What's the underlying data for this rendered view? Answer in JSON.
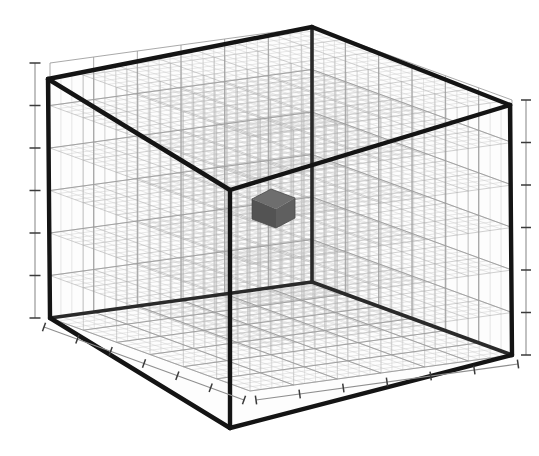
{
  "figure": {
    "title": "",
    "background_color": "#ffffff",
    "width": 539,
    "height": 456
  },
  "chart_data": {
    "type": "scatter",
    "title": "",
    "subtitle": "",
    "xlabel": "",
    "ylabel": "",
    "zlabel": "",
    "projection": "3d",
    "grid": true,
    "legend": null,
    "legend_position": "none",
    "xlim": [
      0,
      6
    ],
    "ylim": [
      0,
      6
    ],
    "zlim": [
      0,
      6
    ],
    "xticks": [
      "",
      "",
      "",
      "",
      "",
      "",
      ""
    ],
    "yticks": [
      "",
      "",
      "",
      "",
      "",
      "",
      ""
    ],
    "zticks": [
      "",
      "",
      "",
      "",
      "",
      "",
      ""
    ],
    "tick_labels_visible": false,
    "tick_count_x": 7,
    "tick_count_y": 7,
    "tick_count_z": 7,
    "mesh_divisions": 24,
    "view_elevation_deg": 22,
    "view_azimuth_deg": -55,
    "series": [
      {
        "name": "voxel",
        "marker": "cube",
        "color": "#5f5f5f",
        "edge_color": "#4a4a4a",
        "points": [
          {
            "x": 3,
            "y": 3,
            "z": 3,
            "size": 1
          }
        ]
      }
    ],
    "colors": {
      "box_edge": "#141414",
      "grid_major": "#9a9a9a",
      "grid_minor": "#c4c4c4",
      "lattice": "#a8a8a8",
      "axis_spine": "#8e8e8e",
      "tick": "#3a3a3a",
      "voxel_top": "#6e6e6e",
      "voxel_left": "#535353",
      "voxel_right": "#5f5f5f",
      "background": "#ffffff"
    }
  },
  "axes": {
    "z_axis": {
      "name": "z-axis-left",
      "tick_count": 6,
      "labels": []
    },
    "z_axis_right": {
      "name": "z-axis-right",
      "tick_count": 6,
      "labels": []
    },
    "x_axis": {
      "name": "x-axis-bottom-left",
      "tick_count": 6,
      "labels": []
    },
    "y_axis": {
      "name": "y-axis-bottom-right",
      "tick_count": 6,
      "labels": []
    }
  }
}
